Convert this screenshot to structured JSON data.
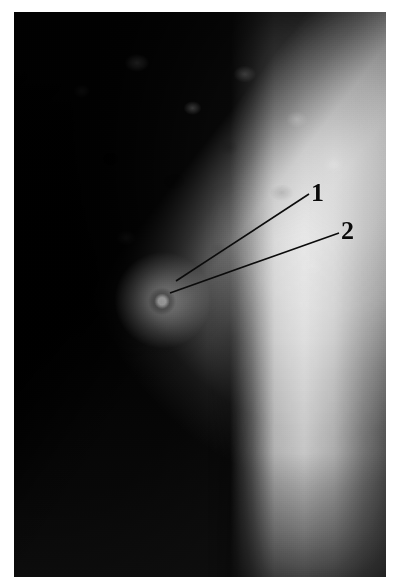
{
  "figure": {
    "kind": "grayscale-radiograph",
    "caption": "",
    "border_color": "#ffffff",
    "plate": {
      "x": 14,
      "y": 12,
      "width": 372,
      "height": 565,
      "background_color": "#050505",
      "bright_color": "#fcfcfc",
      "midtone_color": "#a0a0a0",
      "shadow_color": "#000000"
    },
    "regions": [
      {
        "name": "dark-soft-tissue-background",
        "description": "near-black field occupying the left and lower-left of the plate"
      },
      {
        "name": "bone-lobe",
        "description": "curved bright rounded bone mass filling the upper-right, edge running diagonally from top-centre to lower-left"
      },
      {
        "name": "trabecular-mottling",
        "description": "speckled light and dark granular texture across the upper-right of the bone mass"
      },
      {
        "name": "shaft-band",
        "description": "bright near-vertical band running the full height on the right side of the plate"
      },
      {
        "name": "lesion-halo",
        "description": "localised bright halo in the mid-left of the bone with a small dark ring at its centre"
      }
    ]
  },
  "annotations": {
    "line_color": "#0b0b0b",
    "label_color": "#0a0a0a",
    "callouts": [
      {
        "id": "1",
        "label": "1",
        "label_x": 311,
        "label_y": 180,
        "line": {
          "x1": 309,
          "y1": 194,
          "x2": 176,
          "y2": 281
        }
      },
      {
        "id": "2",
        "label": "2",
        "label_x": 341,
        "label_y": 218,
        "line": {
          "x1": 339,
          "y1": 233,
          "x2": 170,
          "y2": 293
        }
      }
    ]
  }
}
